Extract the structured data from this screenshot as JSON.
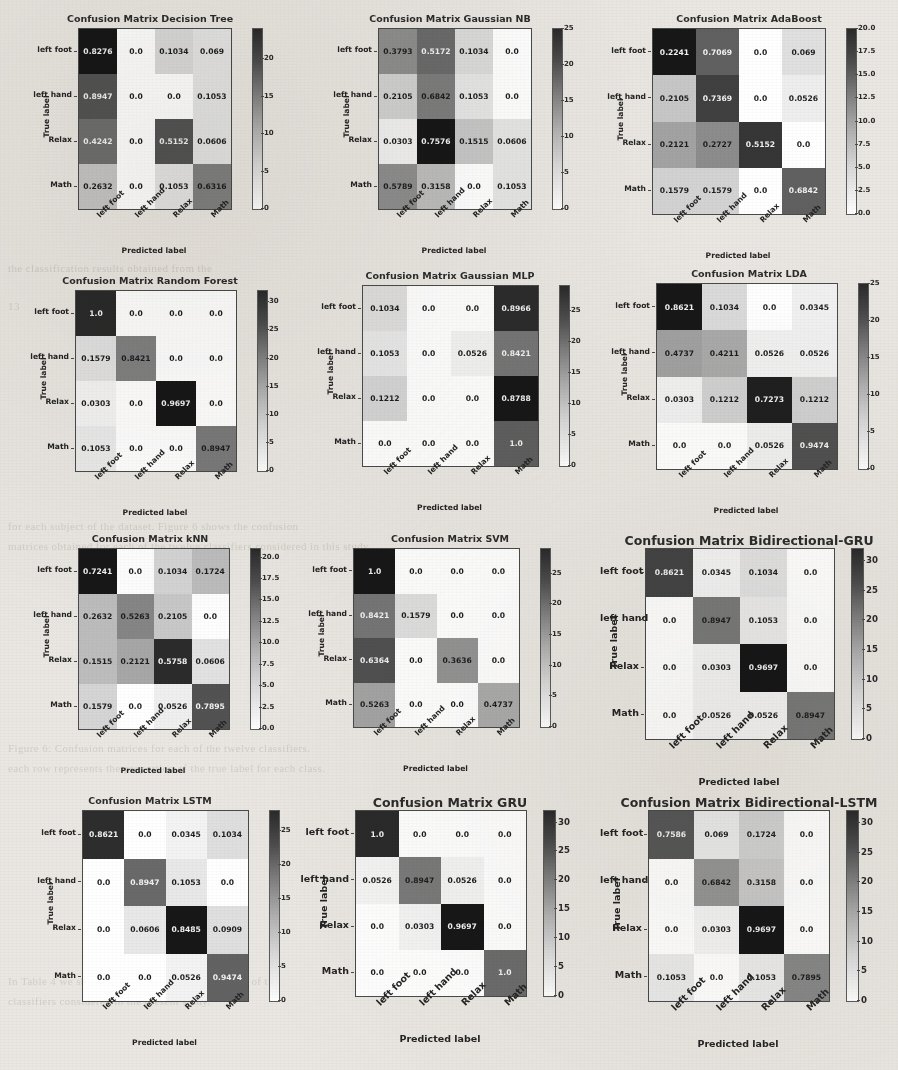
{
  "labels": {
    "classes": [
      "left foot",
      "left hand",
      "Relax",
      "Math"
    ],
    "xaxis_title": "Predicted label",
    "yaxis_title": "True label"
  },
  "ghost_text": [
    {
      "x": 8,
      "y": 262,
      "t": "the classification results obtained from the"
    },
    {
      "x": 8,
      "y": 300,
      "t": "13"
    },
    {
      "x": 8,
      "y": 520,
      "t": "for each subject of the dataset. Figure 6 shows the confusion"
    },
    {
      "x": 8,
      "y": 540,
      "t": "matrices obtained for each of the twelve classifiers considered in this study."
    },
    {
      "x": 8,
      "y": 742,
      "t": "Figure 6: Confusion matrices for each of the twelve classifiers."
    },
    {
      "x": 8,
      "y": 762,
      "t": "each row represents the proportion of the true label for each class."
    },
    {
      "x": 8,
      "y": 975,
      "t": "In Table 4 we show the accuracy obtained by each of the"
    },
    {
      "x": 8,
      "y": 995,
      "t": "classifiers considered in the present study."
    }
  ],
  "chart_data": [
    {
      "type": "heatmap",
      "title": "Confusion Matrix Decision Tree",
      "xlabel": "Predicted label",
      "ylabel": "True label",
      "categories": [
        "left foot",
        "left hand",
        "Relax",
        "Math"
      ],
      "values": [
        [
          0.8276,
          0.0,
          0.1034,
          0.069
        ],
        [
          0.8947,
          0.0,
          0.0,
          0.1053
        ],
        [
          0.4242,
          0.0,
          0.5152,
          0.0606
        ],
        [
          0.2632,
          0.0,
          0.1053,
          0.6316
        ]
      ],
      "display": [
        [
          "0.8276",
          "0.0",
          "0.1034",
          "0.069"
        ],
        [
          "0.8947",
          "0.0",
          "0.0",
          "0.1053"
        ],
        [
          "0.4242",
          "0.0",
          "0.5152",
          "0.0606"
        ],
        [
          "0.2632",
          "0.0",
          "0.1053",
          "0.6316"
        ]
      ],
      "counts": [
        [
          24,
          0,
          3,
          2
        ],
        [
          17,
          0,
          0,
          2
        ],
        [
          14,
          0,
          17,
          2
        ],
        [
          5,
          0,
          2,
          12
        ]
      ],
      "cbar_ticks": [
        "0",
        "5",
        "10",
        "15",
        "20"
      ],
      "cbar_max": 24
    },
    {
      "type": "heatmap",
      "title": "Confusion Matrix Gaussian NB",
      "xlabel": "Predicted label",
      "ylabel": "True label",
      "categories": [
        "left foot",
        "left hand",
        "Relax",
        "Math"
      ],
      "values": [
        [
          0.3793,
          0.5172,
          0.1034,
          0.0
        ],
        [
          0.2105,
          0.6842,
          0.1053,
          0.0
        ],
        [
          0.0303,
          0.7576,
          0.1515,
          0.0606
        ],
        [
          0.5789,
          0.3158,
          0.0,
          0.1053
        ]
      ],
      "display": [
        [
          "0.3793",
          "0.5172",
          "0.1034",
          "0.0"
        ],
        [
          "0.2105",
          "0.6842",
          "0.1053",
          "0.0"
        ],
        [
          "0.0303",
          "0.7576",
          "0.1515",
          "0.0606"
        ],
        [
          "0.5789",
          "0.3158",
          "0.0",
          "0.1053"
        ]
      ],
      "counts": [
        [
          11,
          15,
          3,
          0
        ],
        [
          4,
          13,
          2,
          0
        ],
        [
          1,
          25,
          5,
          2
        ],
        [
          11,
          6,
          0,
          2
        ]
      ],
      "cbar_ticks": [
        "0",
        "5",
        "10",
        "15",
        "20",
        "25"
      ],
      "cbar_max": 25
    },
    {
      "type": "heatmap",
      "title": "Confusion Matrix AdaBoost",
      "xlabel": "Predicted label",
      "ylabel": "True label",
      "categories": [
        "left foot",
        "left hand",
        "Relax",
        "Math"
      ],
      "values": [
        [
          0.2241,
          0.7069,
          0.0,
          0.069
        ],
        [
          0.2105,
          0.7369,
          0.0,
          0.0526
        ],
        [
          0.2121,
          0.2727,
          0.5152,
          0.0
        ],
        [
          0.1579,
          0.1579,
          0.0,
          0.6842
        ]
      ],
      "display": [
        [
          "0.2241",
          "0.7069",
          "0.0",
          "0.069"
        ],
        [
          "0.2105",
          "0.7369",
          "0.0",
          "0.0526"
        ],
        [
          "0.2121",
          "0.2727",
          "0.5152",
          "0.0"
        ],
        [
          "0.1579",
          "0.1579",
          "0.0",
          "0.6842"
        ]
      ],
      "counts": [
        [
          20,
          13,
          0,
          2
        ],
        [
          4,
          16,
          0,
          1
        ],
        [
          7,
          9,
          17,
          0
        ],
        [
          3,
          3,
          0,
          13
        ]
      ],
      "cbar_ticks": [
        "0.0",
        "2.5",
        "5.0",
        "7.5",
        "10.0",
        "12.5",
        "15.0",
        "17.5",
        "20.0"
      ],
      "cbar_max": 20
    },
    {
      "type": "heatmap",
      "title": "Confusion Matrix Random Forest",
      "xlabel": "Predicted label",
      "ylabel": "True label",
      "categories": [
        "left foot",
        "left hand",
        "Relax",
        "Math"
      ],
      "values": [
        [
          1.0,
          0.0,
          0.0,
          0.0
        ],
        [
          0.1579,
          0.8421,
          0.0,
          0.0
        ],
        [
          0.0303,
          0.0,
          0.9697,
          0.0
        ],
        [
          0.1053,
          0.0,
          0.0,
          0.8947
        ]
      ],
      "display": [
        [
          "1.0",
          "0.0",
          "0.0",
          "0.0"
        ],
        [
          "0.1579",
          "0.8421",
          "0.0",
          "0.0"
        ],
        [
          "0.0303",
          "0.0",
          "0.9697",
          "0.0"
        ],
        [
          "0.1053",
          "0.0",
          "0.0",
          "0.8947"
        ]
      ],
      "counts": [
        [
          29,
          0,
          0,
          0
        ],
        [
          3,
          16,
          0,
          0
        ],
        [
          1,
          0,
          32,
          0
        ],
        [
          2,
          0,
          0,
          17
        ]
      ],
      "cbar_ticks": [
        "0",
        "5",
        "10",
        "15",
        "20",
        "25",
        "30"
      ],
      "cbar_max": 32
    },
    {
      "type": "heatmap",
      "title": "Confusion Matrix Gaussian MLP",
      "xlabel": "Predicted label",
      "ylabel": "True label",
      "categories": [
        "left foot",
        "left hand",
        "Relax",
        "Math"
      ],
      "values": [
        [
          0.1034,
          0.0,
          0.0,
          0.8966
        ],
        [
          0.1053,
          0.0,
          0.0526,
          0.8421
        ],
        [
          0.1212,
          0.0,
          0.0,
          0.8788
        ],
        [
          0.0,
          0.0,
          0.0,
          1.0
        ]
      ],
      "display": [
        [
          "0.1034",
          "0.0",
          "0.0",
          "0.8966"
        ],
        [
          "0.1053",
          "0.0",
          "0.0526",
          "0.8421"
        ],
        [
          "0.1212",
          "0.0",
          "0.0",
          "0.8788"
        ],
        [
          "0.0",
          "0.0",
          "0.0",
          "1.0"
        ]
      ],
      "counts": [
        [
          3,
          0,
          0,
          26
        ],
        [
          2,
          0,
          1,
          16
        ],
        [
          4,
          0,
          0,
          29
        ],
        [
          0,
          0,
          0,
          19
        ]
      ],
      "cbar_ticks": [
        "0",
        "5",
        "10",
        "15",
        "20",
        "25"
      ],
      "cbar_max": 29
    },
    {
      "type": "heatmap",
      "title": "Confusion Matrix LDA",
      "xlabel": "Predicted label",
      "ylabel": "True label",
      "categories": [
        "left foot",
        "left hand",
        "Relax",
        "Math"
      ],
      "values": [
        [
          0.8621,
          0.1034,
          0.0,
          0.0345
        ],
        [
          0.4737,
          0.4211,
          0.0526,
          0.0526
        ],
        [
          0.0303,
          0.1212,
          0.7273,
          0.1212
        ],
        [
          0.0,
          0.0,
          0.0526,
          0.9474
        ]
      ],
      "display": [
        [
          "0.8621",
          "0.1034",
          "0.0",
          "0.0345"
        ],
        [
          "0.4737",
          "0.4211",
          "0.0526",
          "0.0526"
        ],
        [
          "0.0303",
          "0.1212",
          "0.7273",
          "0.1212"
        ],
        [
          "0.0",
          "0.0",
          "0.0526",
          "0.9474"
        ]
      ],
      "counts": [
        [
          25,
          3,
          0,
          1
        ],
        [
          9,
          8,
          1,
          1
        ],
        [
          1,
          4,
          24,
          4
        ],
        [
          0,
          0,
          1,
          18
        ]
      ],
      "cbar_ticks": [
        "0",
        "5",
        "10",
        "15",
        "20",
        "25"
      ],
      "cbar_max": 25
    },
    {
      "type": "heatmap",
      "title": "Confusion Matrix kNN",
      "xlabel": "Predicted label",
      "ylabel": "True label",
      "categories": [
        "left foot",
        "left hand",
        "Relax",
        "Math"
      ],
      "values": [
        [
          0.7241,
          0.0,
          0.1034,
          0.1724
        ],
        [
          0.2632,
          0.5263,
          0.2105,
          0.0
        ],
        [
          0.1515,
          0.2121,
          0.5758,
          0.0606
        ],
        [
          0.1579,
          0.0,
          0.0526,
          0.7895
        ]
      ],
      "display": [
        [
          "0.7241",
          "0.0",
          "0.1034",
          "0.1724"
        ],
        [
          "0.2632",
          "0.5263",
          "0.2105",
          "0.0"
        ],
        [
          "0.1515",
          "0.2121",
          "0.5758",
          "0.0606"
        ],
        [
          "0.1579",
          "0.0",
          "0.0526",
          "0.7895"
        ]
      ],
      "counts": [
        [
          21,
          0,
          3,
          5
        ],
        [
          5,
          10,
          4,
          0
        ],
        [
          5,
          7,
          19,
          2
        ],
        [
          3,
          0,
          1,
          15
        ]
      ],
      "cbar_ticks": [
        "0.0",
        "2.5",
        "5.0",
        "7.5",
        "10.0",
        "12.5",
        "15.0",
        "17.5",
        "20.0"
      ],
      "cbar_max": 21
    },
    {
      "type": "heatmap",
      "title": "Confusion Matrix SVM",
      "xlabel": "Predicted label",
      "ylabel": "True label",
      "categories": [
        "left foot",
        "left hand",
        "Relax",
        "Math"
      ],
      "values": [
        [
          1.0,
          0.0,
          0.0,
          0.0
        ],
        [
          0.8421,
          0.1579,
          0.0,
          0.0
        ],
        [
          0.6364,
          0.0,
          0.3636,
          0.0
        ],
        [
          0.5263,
          0.0,
          0.0,
          0.4737
        ]
      ],
      "display": [
        [
          "1.0",
          "0.0",
          "0.0",
          "0.0"
        ],
        [
          "0.8421",
          "0.1579",
          "0.0",
          "0.0"
        ],
        [
          "0.6364",
          "0.0",
          "0.3636",
          "0.0"
        ],
        [
          "0.5263",
          "0.0",
          "0.0",
          "0.4737"
        ]
      ],
      "counts": [
        [
          29,
          0,
          0,
          0
        ],
        [
          16,
          3,
          0,
          0
        ],
        [
          21,
          0,
          12,
          0
        ],
        [
          10,
          0,
          0,
          9
        ]
      ],
      "cbar_ticks": [
        "0",
        "5",
        "10",
        "15",
        "20",
        "25"
      ],
      "cbar_max": 29
    },
    {
      "type": "heatmap",
      "title": "Confusion Matrix Bidirectional-GRU",
      "xlabel": "Predicted label",
      "ylabel": "True label",
      "categories": [
        "left foot",
        "left hand",
        "Relax",
        "Math"
      ],
      "values": [
        [
          0.8621,
          0.0345,
          0.1034,
          0.0
        ],
        [
          0.0,
          0.8947,
          0.1053,
          0.0
        ],
        [
          0.0,
          0.0303,
          0.9697,
          0.0
        ],
        [
          0.0,
          0.0526,
          0.0526,
          0.8947
        ]
      ],
      "display": [
        [
          "0.8621",
          "0.0345",
          "0.1034",
          "0.0"
        ],
        [
          "0.0",
          "0.8947",
          "0.1053",
          "0.0"
        ],
        [
          "0.0",
          "0.0303",
          "0.9697",
          "0.0"
        ],
        [
          "0.0",
          "0.0526",
          "0.0526",
          "0.8947"
        ]
      ],
      "counts": [
        [
          25,
          1,
          3,
          0
        ],
        [
          0,
          17,
          2,
          0
        ],
        [
          0,
          1,
          32,
          0
        ],
        [
          0,
          1,
          1,
          17
        ]
      ],
      "cbar_ticks": [
        "0",
        "5",
        "10",
        "15",
        "20",
        "25",
        "30"
      ],
      "cbar_max": 32
    },
    {
      "type": "heatmap",
      "title": "Confusion Matrix LSTM",
      "xlabel": "Predicted label",
      "ylabel": "True label",
      "categories": [
        "left foot",
        "left hand",
        "Relax",
        "Math"
      ],
      "values": [
        [
          0.8621,
          0.0,
          0.0345,
          0.1034
        ],
        [
          0.0,
          0.8947,
          0.1053,
          0.0
        ],
        [
          0.0,
          0.0606,
          0.8485,
          0.0909
        ],
        [
          0.0,
          0.0,
          0.0526,
          0.9474
        ]
      ],
      "display": [
        [
          "0.8621",
          "0.0",
          "0.0345",
          "0.1034"
        ],
        [
          "0.0",
          "0.8947",
          "0.1053",
          "0.0"
        ],
        [
          "0.0",
          "0.0606",
          "0.8485",
          "0.0909"
        ],
        [
          "0.0",
          "0.0",
          "0.0526",
          "0.9474"
        ]
      ],
      "counts": [
        [
          25,
          0,
          1,
          3
        ],
        [
          0,
          17,
          2,
          0
        ],
        [
          0,
          2,
          28,
          3
        ],
        [
          0,
          0,
          1,
          18
        ]
      ],
      "cbar_ticks": [
        "0",
        "5",
        "10",
        "15",
        "20",
        "25"
      ],
      "cbar_max": 28
    },
    {
      "type": "heatmap",
      "title": "Confusion Matrix GRU",
      "xlabel": "Predicted label",
      "ylabel": "True label",
      "categories": [
        "left foot",
        "left hand",
        "Relax",
        "Math"
      ],
      "values": [
        [
          1.0,
          0.0,
          0.0,
          0.0
        ],
        [
          0.0526,
          0.8947,
          0.0526,
          0.0
        ],
        [
          0.0,
          0.0303,
          0.9697,
          0.0
        ],
        [
          0.0,
          0.0,
          0.0,
          1.0
        ]
      ],
      "display": [
        [
          "1.0",
          "0.0",
          "0.0",
          "0.0"
        ],
        [
          "0.0526",
          "0.8947",
          "0.0526",
          "0.0"
        ],
        [
          "0.0",
          "0.0303",
          "0.9697",
          "0.0"
        ],
        [
          "0.0",
          "0.0",
          "0.0",
          "1.0"
        ]
      ],
      "counts": [
        [
          29,
          0,
          0,
          0
        ],
        [
          1,
          17,
          1,
          0
        ],
        [
          0,
          1,
          32,
          0
        ],
        [
          0,
          0,
          0,
          19
        ]
      ],
      "cbar_ticks": [
        "0",
        "5",
        "10",
        "15",
        "20",
        "25",
        "30"
      ],
      "cbar_max": 32
    },
    {
      "type": "heatmap",
      "title": "Confusion Matrix Bidirectional-LSTM",
      "xlabel": "Predicted label",
      "ylabel": "True label",
      "categories": [
        "left foot",
        "left hand",
        "Relax",
        "Math"
      ],
      "values": [
        [
          0.7586,
          0.069,
          0.1724,
          0.0
        ],
        [
          0.0,
          0.6842,
          0.3158,
          0.0
        ],
        [
          0.0,
          0.0303,
          0.9697,
          0.0
        ],
        [
          0.1053,
          0.0,
          0.1053,
          0.7895
        ]
      ],
      "display": [
        [
          "0.7586",
          "0.069",
          "0.1724",
          "0.0"
        ],
        [
          "0.0",
          "0.6842",
          "0.3158",
          "0.0"
        ],
        [
          "0.0",
          "0.0303",
          "0.9697",
          "0.0"
        ],
        [
          "0.1053",
          "0.0",
          "0.1053",
          "0.7895"
        ]
      ],
      "counts": [
        [
          22,
          2,
          5,
          0
        ],
        [
          0,
          13,
          6,
          0
        ],
        [
          0,
          1,
          32,
          0
        ],
        [
          2,
          0,
          2,
          15
        ]
      ],
      "cbar_ticks": [
        "0",
        "5",
        "10",
        "15",
        "20",
        "25",
        "30"
      ],
      "cbar_max": 32
    }
  ]
}
